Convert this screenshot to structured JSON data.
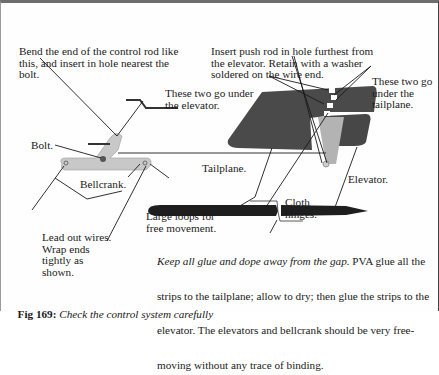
{
  "figure": {
    "number_label": "Fig 169:",
    "caption": "Check the control system carefully"
  },
  "labels": {
    "bend_rod": [
      "Bend the end of the control rod like",
      "this, and insert in hole nearest the",
      "bolt."
    ],
    "push_rod": [
      "Insert push rod in hole furthest from",
      "the elevator. Retain with a washer",
      "soldered on the wire end."
    ],
    "under_elevator": [
      "These two go under",
      "the elevator."
    ],
    "under_tailplane": [
      "These two go",
      "under the",
      "tailplane."
    ],
    "bolt": "Bolt.",
    "bellcrank": "Bellcrank.",
    "large_loops": [
      "Large loops for",
      "free movement."
    ],
    "lead_out": [
      "Lead out wires.",
      "Wrap ends",
      "tightly as",
      "shown."
    ],
    "tailplane": "Tailplane.",
    "cloth_hinges": [
      "Cloth",
      "hinges."
    ],
    "elevator": "Elevator."
  },
  "note": {
    "italic_part": "Keep all glue and dope away from the gap.",
    "line1_rest": " PVA glue all the",
    "line2": "strips to the tailplane; allow to dry; then glue the strips to the",
    "line3": "elevator. The elevators and bellcrank should be very free-",
    "line4": "moving without any trace of binding."
  },
  "colors": {
    "tailplane_fill": "#4a4a4a",
    "bellcrank_fill": "#c8c8c8",
    "hinge_fill": "#b0b0b0",
    "line": "#1a1a1a"
  }
}
